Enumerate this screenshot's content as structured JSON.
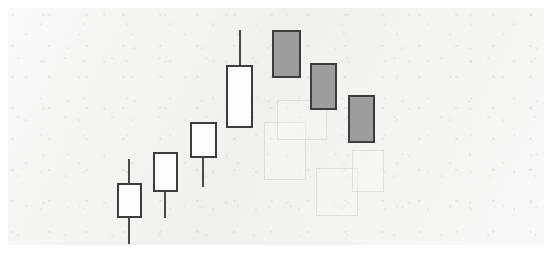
{
  "figure": {
    "title": "",
    "background_color": "#f2f2f1",
    "page_color": "#ffffff"
  },
  "chart_data": {
    "type": "candlestick",
    "title": "",
    "subtitle": "",
    "xlabel": "",
    "ylabel": "",
    "grid": false,
    "legend": null,
    "axis_visible": false,
    "tick_labels": [],
    "annotations": [],
    "colors": {
      "up_body": "#fdfdfd",
      "down_body": "#9d9d9d",
      "outline": "#3d3d3d",
      "wick": "#4a4a4a"
    },
    "ylim": [
      0,
      257
    ],
    "note": "Pixel coordinates are measured top-down from the image origin; lower pixel y means higher price.",
    "candles": [
      {
        "index": 1,
        "label": "session-1",
        "direction": "up",
        "fill": "white",
        "center_x": 129,
        "body_left": 117,
        "body_right": 142,
        "body_top_y": 183,
        "body_bottom_y": 218,
        "wick_top_y": 159,
        "wick_bottom_y": 244,
        "has_upper_wick": true,
        "has_lower_wick": true
      },
      {
        "index": 2,
        "label": "session-2",
        "direction": "up",
        "fill": "white",
        "center_x": 165,
        "body_left": 153,
        "body_right": 178,
        "body_top_y": 152,
        "body_bottom_y": 192,
        "wick_top_y": 152,
        "wick_bottom_y": 218,
        "has_upper_wick": false,
        "has_lower_wick": true
      },
      {
        "index": 3,
        "label": "session-3",
        "direction": "up",
        "fill": "white",
        "center_x": 203,
        "body_left": 190,
        "body_right": 217,
        "body_top_y": 122,
        "body_bottom_y": 158,
        "wick_top_y": 122,
        "wick_bottom_y": 187,
        "has_upper_wick": false,
        "has_lower_wick": true
      },
      {
        "index": 4,
        "label": "session-4",
        "direction": "up",
        "fill": "white",
        "center_x": 240,
        "body_left": 226,
        "body_right": 253,
        "body_top_y": 65,
        "body_bottom_y": 128,
        "wick_top_y": 30,
        "wick_bottom_y": 128,
        "has_upper_wick": true,
        "has_lower_wick": false
      },
      {
        "index": 5,
        "label": "session-5",
        "direction": "down",
        "fill": "gray",
        "center_x": 286,
        "body_left": 272,
        "body_right": 301,
        "body_top_y": 30,
        "body_bottom_y": 78,
        "wick_top_y": 30,
        "wick_bottom_y": 78,
        "has_upper_wick": false,
        "has_lower_wick": false
      },
      {
        "index": 6,
        "label": "session-6",
        "direction": "down",
        "fill": "gray",
        "center_x": 323,
        "body_left": 310,
        "body_right": 337,
        "body_top_y": 63,
        "body_bottom_y": 110,
        "wick_top_y": 63,
        "wick_bottom_y": 110,
        "has_upper_wick": false,
        "has_lower_wick": false
      },
      {
        "index": 7,
        "label": "session-7",
        "direction": "down",
        "fill": "gray",
        "center_x": 361,
        "body_left": 348,
        "body_right": 375,
        "body_top_y": 95,
        "body_bottom_y": 143,
        "wick_top_y": 95,
        "wick_bottom_y": 143,
        "has_upper_wick": false,
        "has_lower_wick": false
      }
    ]
  },
  "ghost_marks": [
    {
      "left": 264,
      "top": 122,
      "width": 40,
      "height": 56
    },
    {
      "left": 277,
      "top": 100,
      "width": 48,
      "height": 38
    },
    {
      "left": 316,
      "top": 168,
      "width": 40,
      "height": 46
    },
    {
      "left": 352,
      "top": 150,
      "width": 30,
      "height": 40
    }
  ]
}
